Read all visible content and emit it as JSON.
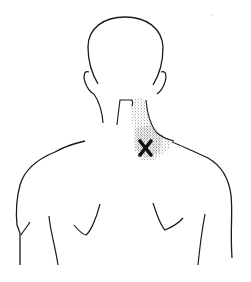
{
  "diagram": {
    "marker": {
      "symbol": "X",
      "meaning": "trigger point location",
      "color": "#111111",
      "x": 146,
      "y": 148
    },
    "referred_pain_area": {
      "style": "stippled",
      "color": "#222222",
      "region": "right side of neck toward upper trapezius"
    },
    "line_color": "#1a1a1a",
    "background": "#ffffff"
  }
}
